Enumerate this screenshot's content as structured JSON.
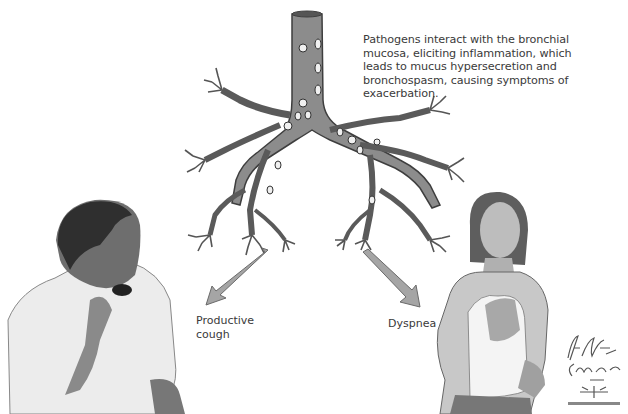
{
  "figure": {
    "caption": "Pathogens interact with the bronchial mucosa, eliciting inflammation, which leads to mucus hypersecretion and bronchospasm, causing symptoms of exacerbation.",
    "caption_lines": [
      "Pathogens interact with the bronchial",
      "mucosa, eliciting inflammation, which",
      "leads to mucus hypersecretion and",
      "bronchospasm, causing symptoms of",
      "exacerbation."
    ],
    "symptoms": [
      {
        "label_lines": [
          "Productive",
          "cough"
        ]
      },
      {
        "label_lines": [
          "Dyspnea"
        ]
      }
    ],
    "signature": {
      "artist1": "F. Netter M.D.",
      "artist2": "C. Machado M.D."
    }
  },
  "colors": {
    "airway_fill": "#8a8a8a",
    "airway_dark": "#4a4a4a",
    "arrow": "#9a9a9a",
    "text": "#3a3a3a"
  }
}
